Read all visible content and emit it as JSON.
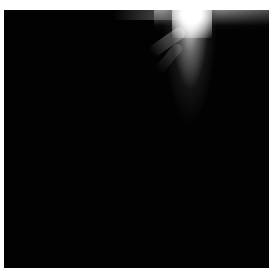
{
  "image": {
    "description": "Dark square frame with a bright white light burst emanating from the top edge, right of center",
    "colors": {
      "background": "#ffffff",
      "frame": "#020202",
      "light": "#ffffff"
    }
  }
}
